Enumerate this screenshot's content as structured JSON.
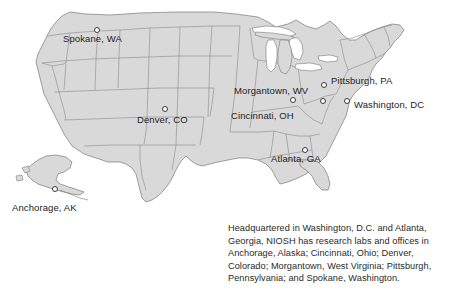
{
  "figure": {
    "map_fill_color": "#d9d9d9",
    "map_stroke_color": "#7a7a7a",
    "background_color": "#ffffff",
    "marker_fill_color": "#ffffff",
    "marker_stroke_color": "#3a3a3a",
    "text_color": "#2a2a2a"
  },
  "cities": [
    {
      "label": "Spokane, WA",
      "marker_x": 94,
      "marker_y": 27,
      "label_x": 63,
      "label_y": 33
    },
    {
      "label": "Denver, CO",
      "marker_x": 162,
      "marker_y": 106,
      "label_x": 137,
      "label_y": 114
    },
    {
      "label": "Morgantown, WV",
      "marker_x": 320,
      "marker_y": 98,
      "label_x": 234,
      "label_y": 85
    },
    {
      "label": "Cincinnati, OH",
      "marker_x": 290,
      "marker_y": 97,
      "label_x": 231,
      "label_y": 110
    },
    {
      "label": "Pittsburgh, PA",
      "marker_x": 321,
      "marker_y": 82,
      "label_x": 331,
      "label_y": 75
    },
    {
      "label": "Washington, DC",
      "marker_x": 344,
      "marker_y": 98,
      "label_x": 354,
      "label_y": 99
    },
    {
      "label": "Atlanta, GA",
      "marker_x": 302,
      "marker_y": 147,
      "label_x": 271,
      "label_y": 153
    },
    {
      "label": "Anchorage, AK",
      "marker_x": 52,
      "marker_y": 186,
      "label_x": 12,
      "label_y": 202
    }
  ],
  "caption": {
    "lines": [
      "Headquartered in Washington, D.C. and Atlanta,",
      "Georgia, NIOSH has research labs and offices in",
      "Anchorage, Alaska; Cincinnati, Ohio; Denver,",
      "Colorado; Morgantown, West Virginia; Pittsburgh,",
      "Pennsylvania; and Spokane, Washington."
    ]
  }
}
